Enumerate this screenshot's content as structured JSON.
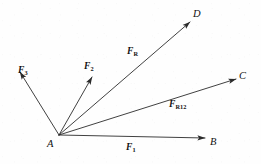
{
  "figure": {
    "background_color": "#fefefe",
    "ink_color": "#2b2b2b",
    "width": 261,
    "height": 164
  },
  "origin": {
    "name": "A",
    "label": "A",
    "x": 59,
    "y": 135,
    "label_x": 47,
    "label_y": 139
  },
  "vectors": [
    {
      "id": "f1",
      "label_main": "F",
      "label_sub": "1",
      "from_x": 59,
      "from_y": 135,
      "to_x": 205,
      "to_y": 138,
      "label_x": 126,
      "label_y": 143,
      "endpoint_label": "B",
      "endpoint_label_x": 210,
      "endpoint_label_y": 137
    },
    {
      "id": "f2",
      "label_main": "F",
      "label_sub": "2",
      "from_x": 59,
      "from_y": 135,
      "to_x": 92,
      "to_y": 77,
      "label_x": 84,
      "label_y": 62,
      "endpoint_label": "",
      "endpoint_label_x": 0,
      "endpoint_label_y": 0
    },
    {
      "id": "f3",
      "label_main": "F",
      "label_sub": "3",
      "from_x": 59,
      "from_y": 135,
      "to_x": 20,
      "to_y": 72,
      "label_x": 18,
      "label_y": 66,
      "endpoint_label": "",
      "endpoint_label_x": 0,
      "endpoint_label_y": 0
    },
    {
      "id": "fr",
      "label_main": "F",
      "label_sub": "R",
      "from_x": 59,
      "from_y": 135,
      "to_x": 190,
      "to_y": 22,
      "label_x": 127,
      "label_y": 47,
      "endpoint_label": "D",
      "endpoint_label_x": 193,
      "endpoint_label_y": 9
    },
    {
      "id": "fr12",
      "label_main": "F",
      "label_sub": "R12",
      "from_x": 59,
      "from_y": 135,
      "to_x": 236,
      "to_y": 79,
      "label_x": 169,
      "label_y": 100,
      "endpoint_label": "C",
      "endpoint_label_x": 239,
      "endpoint_label_y": 71
    }
  ]
}
